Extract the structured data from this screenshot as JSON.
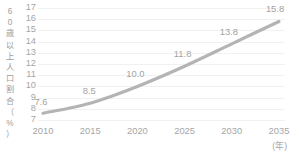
{
  "chart_data": {
    "type": "line",
    "title": "",
    "subtitle": "",
    "xlabel": "(年)",
    "ylabel": "60歳以上人口割合（%）",
    "ylabel_chars": [
      "6",
      "0",
      "歳",
      "以",
      "上",
      "人",
      "口",
      "割",
      "合",
      "（",
      "%",
      "）"
    ],
    "categories": [
      "2010",
      "2015",
      "2020",
      "2025",
      "2030",
      "2035"
    ],
    "x": [
      2010,
      2015,
      2020,
      2025,
      2030,
      2035
    ],
    "values": [
      7.6,
      8.5,
      10.0,
      11.8,
      13.8,
      15.8
    ],
    "data_labels": [
      "7.6",
      "8.5",
      "10.0",
      "11.8",
      "13.8",
      "15.8"
    ],
    "ylim": [
      7,
      17
    ],
    "ytick_labels": [
      "17",
      "16",
      "15",
      "14",
      "13",
      "12",
      "11",
      "10",
      "9",
      "8",
      "7"
    ],
    "ytick_values": [
      17,
      16,
      15,
      14,
      13,
      12,
      11,
      10,
      9,
      8,
      7
    ],
    "xlim": [
      2010,
      2035
    ],
    "grid": true,
    "grid_axis": "y",
    "legend": false,
    "legend_position": "none",
    "markers": false,
    "smooth": true,
    "series": [
      {
        "name": "60歳以上人口割合",
        "values": [
          7.6,
          8.5,
          10.0,
          11.8,
          13.8,
          15.8
        ]
      }
    ],
    "colors": {
      "line": "#b4b4b4",
      "grid": "#f1f1f1",
      "text": "#a6a6a6",
      "data_label": "#a3a3a3",
      "background": "#ffffff"
    }
  }
}
